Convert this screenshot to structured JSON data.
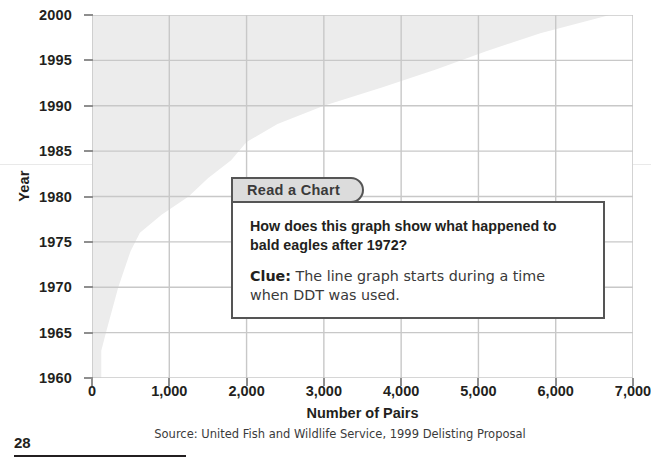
{
  "page": {
    "number": "28",
    "source_note": "Source: United Fish and Wildlife Service, 1999 Delisting Proposal"
  },
  "callout": {
    "tab_label": "Read a Chart",
    "question": "How does this graph show what happened to bald eagles after 1972?",
    "clue_label": "Clue:",
    "clue_text": " The line graph starts during a time when DDT was used."
  },
  "chart_data": {
    "type": "area",
    "title": "",
    "xlabel": "Number of Pairs",
    "ylabel": "Year",
    "xlim": [
      0,
      7000
    ],
    "ylim": [
      1960,
      2000
    ],
    "grid": true,
    "legend": "none",
    "orientation": "horizontal",
    "x_ticks": [
      "0",
      "1,000",
      "2,000",
      "3,000",
      "4,000",
      "5,000",
      "6,000",
      "7,000"
    ],
    "x_tick_values": [
      0,
      1000,
      2000,
      3000,
      4000,
      5000,
      6000,
      7000
    ],
    "y_ticks": [
      "1960",
      "1965",
      "1970",
      "1975",
      "1980",
      "1985",
      "1990",
      "1995",
      "2000"
    ],
    "y_tick_values": [
      1960,
      1965,
      1970,
      1975,
      1980,
      1985,
      1990,
      1995,
      2000
    ],
    "series": [
      {
        "name": "Bald eagle nesting pairs",
        "fill_color": "#ececec",
        "years": [
          1960,
          1963,
          1965,
          1970,
          1972,
          1974,
          1976,
          1978,
          1980,
          1982,
          1984,
          1986,
          1988,
          1990,
          1992,
          1994,
          1996,
          1998,
          2000
        ],
        "pairs": [
          120,
          120,
          180,
          340,
          420,
          500,
          620,
          900,
          1250,
          1500,
          1800,
          2000,
          2400,
          3000,
          3750,
          4450,
          5100,
          5800,
          6700
        ]
      }
    ]
  },
  "colors": {
    "area_fill": "#ececec",
    "gridline": "#c8c8c8",
    "axis_text": "#231f20",
    "callout_border": "#555555",
    "callout_tab_fill": "#dcdcdc"
  }
}
